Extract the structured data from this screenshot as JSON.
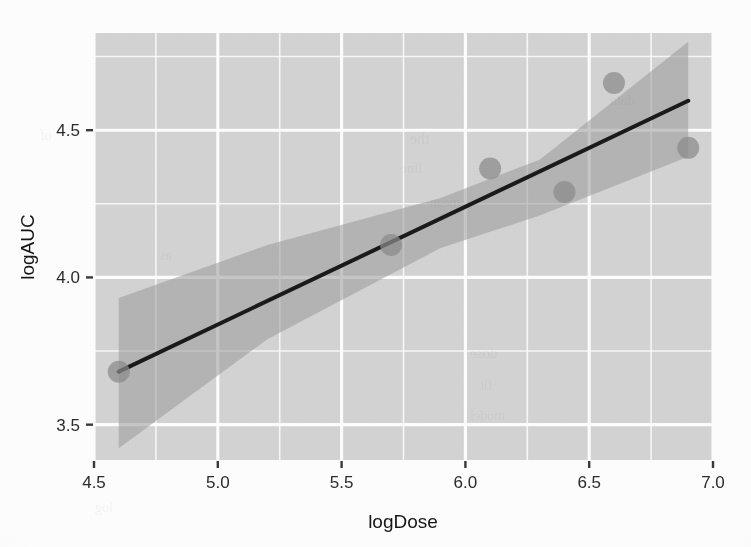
{
  "chart_data": {
    "type": "scatter",
    "title": "",
    "subtitle": "",
    "xlabel": "logDose",
    "ylabel": "logAUC",
    "xlim": [
      4.5,
      7.0
    ],
    "ylim": [
      3.38,
      4.83
    ],
    "xticks": [
      "4.5",
      "5.0",
      "5.5",
      "6.0",
      "6.5",
      "7.0"
    ],
    "xtick_values": [
      4.5,
      5.0,
      5.5,
      6.0,
      6.5,
      7.0
    ],
    "yticks": [
      "4.5",
      "4.0",
      "3.5"
    ],
    "ytick_values": [
      4.5,
      4.0,
      3.5
    ],
    "x_minor_ticks": [
      4.75,
      5.25,
      5.75,
      6.25,
      6.75
    ],
    "y_minor_ticks": [
      3.75,
      4.25,
      4.75
    ],
    "grid": true,
    "legend": "none",
    "points": [
      {
        "x": 4.6,
        "y": 3.68
      },
      {
        "x": 5.7,
        "y": 4.11
      },
      {
        "x": 6.1,
        "y": 4.37
      },
      {
        "x": 6.4,
        "y": 4.29
      },
      {
        "x": 6.6,
        "y": 4.66
      },
      {
        "x": 6.9,
        "y": 4.44
      }
    ],
    "series": [
      {
        "name": "observations",
        "type": "scatter",
        "x": [
          4.6,
          5.7,
          6.1,
          6.4,
          6.6,
          6.9
        ],
        "values": [
          3.68,
          4.11,
          4.37,
          4.29,
          4.66,
          4.44
        ],
        "marker": "filled-circle",
        "marker_color": "#8c8c8c",
        "marker_size_px": 11
      },
      {
        "name": "linear-fit",
        "type": "line",
        "x": [
          4.6,
          6.9
        ],
        "values": [
          3.68,
          4.6
        ],
        "color": "#1a1a1a",
        "width_px": 4,
        "slope": 0.4,
        "intercept": 1.84
      },
      {
        "name": "confidence-band",
        "type": "area",
        "x": [
          4.6,
          5.2,
          5.9,
          6.3,
          6.9
        ],
        "upper": [
          3.93,
          4.11,
          4.27,
          4.4,
          4.8
        ],
        "lower": [
          3.42,
          3.79,
          4.1,
          4.21,
          4.41
        ],
        "fill": "#9a9a9a",
        "opacity": 0.55
      }
    ],
    "panel_background": "#d5d5d5",
    "gridline_color": "#ffffff",
    "axis_text_color": "#2b2b2b",
    "plot_background": "#ffffff"
  },
  "ghost_text": [
    {
      "text": "data",
      "x": 610,
      "y": 92,
      "size": 15
    },
    {
      "text": "of",
      "x": 40,
      "y": 128,
      "size": 14
    },
    {
      "text": "the",
      "x": 410,
      "y": 130,
      "size": 16
    },
    {
      "text": "line",
      "x": 400,
      "y": 160,
      "size": 15
    },
    {
      "text": "mean",
      "x": 430,
      "y": 195,
      "size": 14
    },
    {
      "text": "as",
      "x": 160,
      "y": 248,
      "size": 14
    },
    {
      "text": "dose",
      "x": 470,
      "y": 345,
      "size": 15
    },
    {
      "text": "fit",
      "x": 480,
      "y": 378,
      "size": 14
    },
    {
      "text": "model",
      "x": 470,
      "y": 408,
      "size": 14
    },
    {
      "text": "log",
      "x": 95,
      "y": 500,
      "size": 14
    }
  ]
}
